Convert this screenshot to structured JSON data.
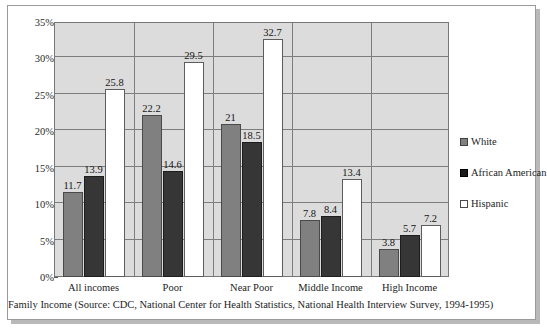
{
  "chart_data": {
    "type": "bar",
    "title": "",
    "subtitle": "",
    "xlabel": "Family Income (Source: CDC, National Center for Health Statistics, National Health Interview Survey, 1994-1995)",
    "ylabel": "",
    "ylim": [
      0,
      35
    ],
    "ytick_labels": [
      "0%",
      "5%",
      "10%",
      "15%",
      "20%",
      "25%",
      "30%",
      "35%"
    ],
    "ytick_values": [
      0,
      5,
      10,
      15,
      20,
      25,
      30,
      35
    ],
    "grid": true,
    "legend_position": "right",
    "categories": [
      "All incomes",
      "Poor",
      "Near Poor",
      "Middle Income",
      "High Income"
    ],
    "series": [
      {
        "name": "White",
        "color": "#808080",
        "values": [
          11.7,
          22.2,
          21,
          7.8,
          3.8
        ],
        "labels": [
          "11.7",
          "22.2",
          "21",
          "7.8",
          "3.8"
        ]
      },
      {
        "name": "African American",
        "color": "#363636",
        "values": [
          13.9,
          14.6,
          18.5,
          8.4,
          5.7
        ],
        "labels": [
          "13.9",
          "14.6",
          "18.5",
          "8.4",
          "5.7"
        ]
      },
      {
        "name": "Hispanic",
        "color": "#ffffff",
        "values": [
          25.8,
          29.5,
          32.7,
          13.4,
          7.2
        ],
        "labels": [
          "25.8",
          "29.5",
          "32.7",
          "13.4",
          "7.2"
        ]
      }
    ]
  },
  "legend": {
    "items": [
      {
        "label": "White",
        "swatch": "gray"
      },
      {
        "label": "African American",
        "swatch": "dark"
      },
      {
        "label": "Hispanic",
        "swatch": "white"
      }
    ]
  },
  "axis": {
    "caption": "Family Income (Source: CDC, National Center for Health Statistics, National Health Interview Survey, 1994-1995)"
  }
}
